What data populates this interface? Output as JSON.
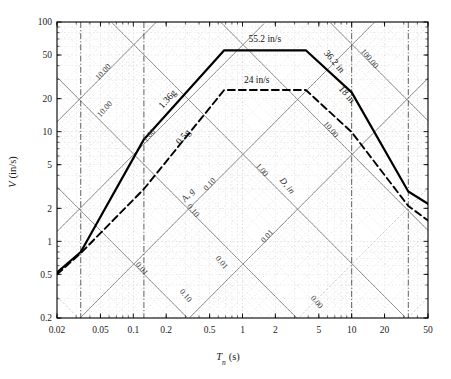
{
  "figure": {
    "kind": "tripartite-response-spectrum",
    "background": "#ffffff",
    "frame_color": "#000000"
  },
  "axes": {
    "x": {
      "label_main": "T",
      "label_sub": "n",
      "label_unit": "(s)",
      "label_full": "Tn (s)",
      "min": 0.02,
      "max": 50,
      "scale": "log",
      "ticks": [
        {
          "value": 0.02,
          "text": "0.02"
        },
        {
          "value": 0.05,
          "text": "0.05"
        },
        {
          "value": 0.1,
          "text": "0.1"
        },
        {
          "value": 0.2,
          "text": "0.2"
        },
        {
          "value": 0.5,
          "text": "0.5"
        },
        {
          "value": 1,
          "text": "1"
        },
        {
          "value": 2,
          "text": "2"
        },
        {
          "value": 5,
          "text": "5"
        },
        {
          "value": 10,
          "text": "10"
        },
        {
          "value": 20,
          "text": "20"
        },
        {
          "value": 50,
          "text": "50"
        }
      ]
    },
    "y": {
      "label_main": "V",
      "label_unit": "(in/s)",
      "label_full": "V (in/s)",
      "min": 0.2,
      "max": 100,
      "scale": "log",
      "ticks": [
        {
          "value": 100,
          "text": "100"
        },
        {
          "value": 50,
          "text": "50"
        },
        {
          "value": 20,
          "text": "20"
        },
        {
          "value": 10,
          "text": "10"
        },
        {
          "value": 5,
          "text": "5"
        },
        {
          "value": 2,
          "text": "2"
        },
        {
          "value": 1,
          "text": "1"
        },
        {
          "value": 0.5,
          "text": "0.5"
        },
        {
          "value": 0.2,
          "text": "0.2"
        }
      ]
    }
  },
  "chart_data": {
    "type": "line",
    "title": "",
    "xlabel": "Tn (s)",
    "ylabel": "V (in/s)",
    "xlim": [
      0.02,
      50
    ],
    "ylim": [
      0.2,
      100
    ],
    "xscale": "log",
    "yscale": "log",
    "grid": "tripartite-log (diagonal A and D axes)",
    "legend": "none",
    "series": [
      {
        "name": "elastic design spectrum",
        "style": "solid",
        "color": "#000000",
        "width": 2.2,
        "points": [
          {
            "x": 0.02,
            "y": 0.52
          },
          {
            "x": 0.033,
            "y": 0.8
          },
          {
            "x": 0.125,
            "y": 8.5
          },
          {
            "x": 0.68,
            "y": 55.2
          },
          {
            "x": 3.8,
            "y": 55.2
          },
          {
            "x": 10.0,
            "y": 22.8
          },
          {
            "x": 33.0,
            "y": 2.85
          },
          {
            "x": 50.0,
            "y": 2.2
          }
        ]
      },
      {
        "name": "reduced design spectrum",
        "style": "dashed",
        "color": "#000000",
        "width": 1.9,
        "points": [
          {
            "x": 0.02,
            "y": 0.5
          },
          {
            "x": 0.033,
            "y": 0.78
          },
          {
            "x": 0.125,
            "y": 3.0
          },
          {
            "x": 0.68,
            "y": 24.0
          },
          {
            "x": 3.8,
            "y": 24.0
          },
          {
            "x": 10.0,
            "y": 9.9
          },
          {
            "x": 33.0,
            "y": 2.1
          },
          {
            "x": 50.0,
            "y": 1.55
          }
        ]
      }
    ],
    "control_values": {
      "elastic_acceleration_g": 1.36,
      "elastic_velocity_in_s": 55.2,
      "elastic_displacement_in": 36.2,
      "reduced_acceleration_g": 0.5,
      "reduced_velocity_in_s": 24,
      "reduced_displacement_in": 18
    },
    "vertical_markers": [
      0.033,
      0.125,
      10.0,
      33.0
    ]
  },
  "annotations": {
    "peak_velocity_elastic": "55.2 in/s",
    "peak_velocity_reduced": "24 in/s",
    "accel_elastic": "1.36g",
    "accel_reduced": "0.5g",
    "disp_elastic": "36.2 in",
    "disp_reduced": "18 in"
  },
  "diagonals": {
    "acceleration": {
      "axis_name": "A, g",
      "labels": [
        "10.00",
        "1.00",
        "0.10",
        "0.01"
      ]
    },
    "displacement": {
      "axis_name": "D, in",
      "labels": [
        "100.00",
        "10.00",
        "1.00",
        "0.10",
        "0.01",
        "0.00"
      ]
    }
  }
}
